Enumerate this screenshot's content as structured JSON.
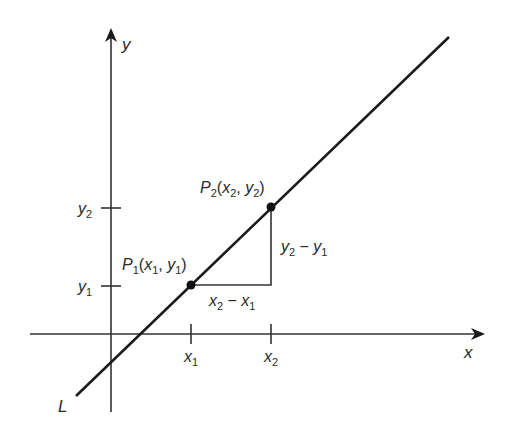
{
  "diagram": {
    "axes": {
      "x_label": "x",
      "y_label": "y"
    },
    "line_label": "L",
    "ticks": {
      "x": [
        {
          "main": "x",
          "sub": "1"
        },
        {
          "main": "x",
          "sub": "2"
        }
      ],
      "y": [
        {
          "main": "y",
          "sub": "2"
        },
        {
          "main": "y",
          "sub": "1"
        }
      ]
    },
    "points": [
      {
        "name_main": "P",
        "name_sub": "1",
        "open": "(",
        "x_main": "x",
        "x_sub": "1",
        "comma": ", ",
        "y_main": "y",
        "y_sub": "1",
        "close": ")"
      },
      {
        "name_main": "P",
        "name_sub": "2",
        "open": "(",
        "x_main": "x",
        "x_sub": "2",
        "comma": ", ",
        "y_main": "y",
        "y_sub": "2",
        "close": ")"
      }
    ],
    "rise_label": {
      "a_main": "y",
      "a_sub": "2",
      "minus": " − ",
      "b_main": "y",
      "b_sub": "1"
    },
    "run_label": {
      "a_main": "x",
      "a_sub": "2",
      "minus": " − ",
      "b_main": "x",
      "b_sub": "1"
    },
    "colors": {
      "ink": "#1a1a1a",
      "axis": "#333333",
      "background": "#ffffff"
    }
  }
}
